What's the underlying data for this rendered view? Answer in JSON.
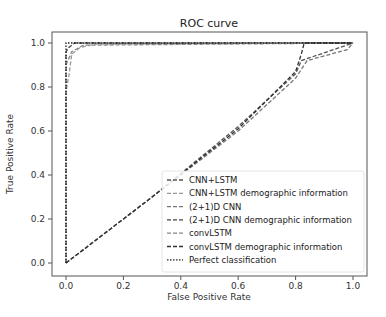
{
  "chart_data": {
    "type": "line",
    "title": "ROC curve",
    "xlabel": "False Positive Rate",
    "ylabel": "True Positive Rate",
    "xlim": [
      0.0,
      1.0
    ],
    "ylim": [
      0.0,
      1.0
    ],
    "xticks": [
      "0.0",
      "0.2",
      "0.4",
      "0.6",
      "0.8",
      "1.0"
    ],
    "yticks": [
      "0.0",
      "0.2",
      "0.4",
      "0.6",
      "0.8",
      "1.0"
    ],
    "grid": false,
    "legend_position": "lower right",
    "series": [
      {
        "name": "CNN+LSTM",
        "color": "#555555",
        "style": "dashed",
        "x": [
          0,
          0.3,
          0.6,
          0.8,
          0.82,
          1.0
        ],
        "y": [
          0,
          0.3,
          0.62,
          0.86,
          0.92,
          1.0
        ]
      },
      {
        "name": "CNN+LSTM demographic information",
        "color": "#999999",
        "style": "dashed",
        "x": [
          0,
          0,
          0.01,
          0.02,
          0.05,
          0.1,
          1.0
        ],
        "y": [
          0,
          0.78,
          0.85,
          0.95,
          0.98,
          0.995,
          1.0
        ]
      },
      {
        "name": "(2+1)D CNN",
        "color": "#777777",
        "style": "dashed",
        "x": [
          0,
          0.3,
          0.6,
          0.8,
          0.84,
          0.98,
          1.0
        ],
        "y": [
          0,
          0.3,
          0.6,
          0.84,
          0.92,
          0.97,
          1.0
        ]
      },
      {
        "name": "(2+1)D CNN demographic information",
        "color": "#444444",
        "style": "dashed",
        "x": [
          0,
          0,
          0.01,
          0.03,
          1.0
        ],
        "y": [
          0,
          0.96,
          0.98,
          1.0,
          1.0
        ]
      },
      {
        "name": "convLSTM",
        "color": "#888888",
        "style": "dashed",
        "x": [
          0,
          0,
          0.02,
          0.06,
          1.0
        ],
        "y": [
          0,
          0.9,
          0.96,
          0.99,
          1.0
        ]
      },
      {
        "name": "convLSTM demographic information",
        "color": "#333333",
        "style": "dashed",
        "x": [
          0,
          0.3,
          0.6,
          0.8,
          0.82,
          0.83,
          1.0
        ],
        "y": [
          0,
          0.3,
          0.61,
          0.87,
          0.95,
          1.0,
          1.0
        ]
      },
      {
        "name": "Perfect classification",
        "color": "#222222",
        "style": "dotted",
        "x": [
          0,
          0,
          1
        ],
        "y": [
          0,
          1,
          1
        ]
      }
    ]
  }
}
